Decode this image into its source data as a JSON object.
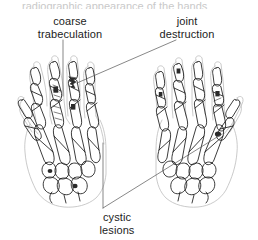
{
  "figure": {
    "title_cropped": "radiographic appearance of the hands",
    "background_color": "#ffffff",
    "line_color": "#1a1a1a",
    "soft_tissue_color": "#b9b9b9",
    "lesion_fill": "#2b2b2b"
  },
  "labels": {
    "coarse_trabeculation": "coarse\ntrabeculation",
    "joint_destruction": "joint\ndestruction",
    "cystic_lesions": "cystic\nlesions"
  },
  "annotations": [
    {
      "name": "coarse-trabeculation",
      "text": "coarse trabeculation",
      "leader": "vertical",
      "target": "left hand middle finger proximal phalanx"
    },
    {
      "name": "joint-destruction",
      "text": "joint destruction",
      "leader": "diagonal down-left",
      "target": "left hand ring finger distal interphalangeal joint"
    },
    {
      "name": "cystic-lesions",
      "text": "cystic lesions",
      "leader": "vertical and diagonal up-right",
      "target": "left hand carpus and right hand second metacarpal base"
    }
  ],
  "hands": [
    {
      "name": "left-hand",
      "side": "left",
      "view": "dorsopalmar radiograph tracing"
    },
    {
      "name": "right-hand",
      "side": "right",
      "view": "dorsopalmar radiograph tracing"
    }
  ]
}
